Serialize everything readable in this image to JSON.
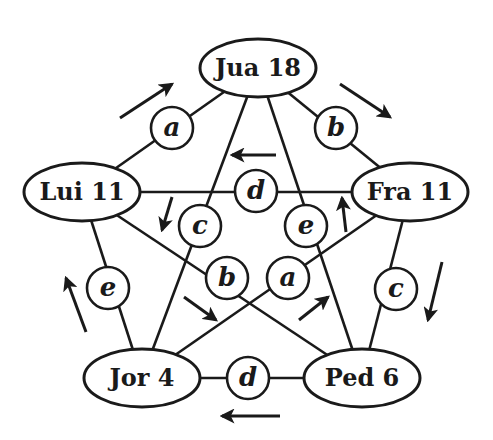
{
  "diagram": {
    "type": "graph",
    "layout": "pentagon with pentagram",
    "colors": {
      "ink": "#1a1a1a",
      "background": "#ffffff"
    },
    "nodes": [
      {
        "id": "jua",
        "label": "Jua 18",
        "name": "Jua",
        "value": 18,
        "x": 258,
        "y": 68
      },
      {
        "id": "lui",
        "label": "Lui 11",
        "name": "Lui",
        "value": 11,
        "x": 82,
        "y": 192
      },
      {
        "id": "fra",
        "label": "Fra 11",
        "name": "Fra",
        "value": 11,
        "x": 410,
        "y": 192
      },
      {
        "id": "jor",
        "label": "Jor 4",
        "name": "Jor",
        "value": 4,
        "x": 142,
        "y": 378
      },
      {
        "id": "ped",
        "label": "Ped 6",
        "name": "Ped",
        "value": 6,
        "x": 362,
        "y": 378
      }
    ],
    "edges": [
      {
        "from": "jua",
        "to": "lui",
        "label": "a",
        "lx": 172,
        "ly": 128
      },
      {
        "from": "jua",
        "to": "fra",
        "label": "b",
        "lx": 336,
        "ly": 128
      },
      {
        "from": "lui",
        "to": "fra",
        "label": "d",
        "lx": 256,
        "ly": 191
      },
      {
        "from": "jua",
        "to": "jor",
        "label": "c",
        "lx": 200,
        "ly": 226
      },
      {
        "from": "jua",
        "to": "ped",
        "label": "e",
        "lx": 306,
        "ly": 226
      },
      {
        "from": "lui",
        "to": "ped",
        "label": "b",
        "lx": 227,
        "ly": 278
      },
      {
        "from": "fra",
        "to": "jor",
        "label": "a",
        "lx": 288,
        "ly": 278
      },
      {
        "from": "lui",
        "to": "jor",
        "label": "e",
        "lx": 108,
        "ly": 288
      },
      {
        "from": "fra",
        "to": "ped",
        "label": "c",
        "lx": 396,
        "ly": 289
      },
      {
        "from": "jor",
        "to": "ped",
        "label": "d",
        "lx": 248,
        "ly": 378
      }
    ],
    "arrows": [
      {
        "id": "arrow-lui-to-jua",
        "direction": "up-right",
        "x1": 120,
        "y1": 118,
        "x2": 172,
        "y2": 84
      },
      {
        "id": "arrow-jua-to-fra",
        "direction": "down-right",
        "x1": 340,
        "y1": 84,
        "x2": 390,
        "y2": 117
      },
      {
        "id": "arrow-fra-to-lui",
        "direction": "left",
        "x1": 276,
        "y1": 155,
        "x2": 232,
        "y2": 155
      },
      {
        "id": "arrow-down-left-inner",
        "direction": "down",
        "x1": 172,
        "y1": 197,
        "x2": 162,
        "y2": 230
      },
      {
        "id": "arrow-up-right-inner",
        "direction": "up",
        "x1": 346,
        "y1": 232,
        "x2": 342,
        "y2": 198
      },
      {
        "id": "arrow-fra-to-ped",
        "direction": "down",
        "x1": 442,
        "y1": 262,
        "x2": 428,
        "y2": 320
      },
      {
        "id": "arrow-jor-to-lui",
        "direction": "up",
        "x1": 86,
        "y1": 332,
        "x2": 66,
        "y2": 278
      },
      {
        "id": "arrow-lui-to-ped-inner",
        "direction": "down-right",
        "x1": 184,
        "y1": 297,
        "x2": 216,
        "y2": 320
      },
      {
        "id": "arrow-jor-to-fra-inner",
        "direction": "up-right",
        "x1": 299,
        "y1": 320,
        "x2": 328,
        "y2": 297
      },
      {
        "id": "arrow-ped-to-jor",
        "direction": "left",
        "x1": 280,
        "y1": 416,
        "x2": 222,
        "y2": 416
      }
    ]
  }
}
